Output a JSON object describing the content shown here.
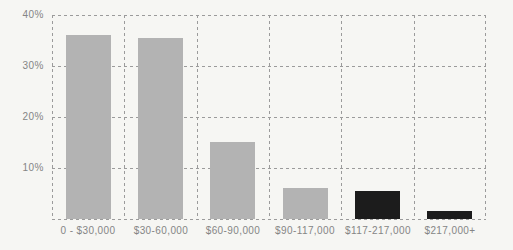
{
  "figure": {
    "background": "#f6f6f3",
    "gridline_color": "#9b9b9b",
    "label_color": "#858585",
    "bar_gray": "#b3b3b3",
    "bar_black": "#1c1c1c"
  },
  "chart_data": {
    "type": "bar",
    "title": "",
    "xlabel": "",
    "ylabel": "",
    "categories": [
      "0 - $30,000",
      "$30-60,000",
      "$60-90,000",
      "$90-117,000",
      "$117-217,000",
      "$217,000+"
    ],
    "values": [
      36,
      35.5,
      15,
      6,
      5.5,
      1.5
    ],
    "bar_colors": [
      "#b3b3b3",
      "#b3b3b3",
      "#b3b3b3",
      "#b3b3b3",
      "#1c1c1c",
      "#1c1c1c"
    ],
    "ylim": [
      0,
      40
    ],
    "yticks": [
      40,
      30,
      20,
      10
    ],
    "ytick_labels": [
      "40%",
      "30%",
      "20%",
      "10%"
    ],
    "grid": "dashed",
    "legend": "none"
  }
}
